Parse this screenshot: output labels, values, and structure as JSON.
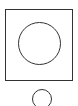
{
  "figure": {
    "shapes": [
      {
        "type": "square-frame",
        "stroke": "#333333"
      },
      {
        "type": "circle-large",
        "stroke": "#333333",
        "inside": "square-frame"
      },
      {
        "type": "circle-small",
        "stroke": "#333333",
        "position": "below-frame"
      }
    ],
    "background": "#ffffff"
  }
}
